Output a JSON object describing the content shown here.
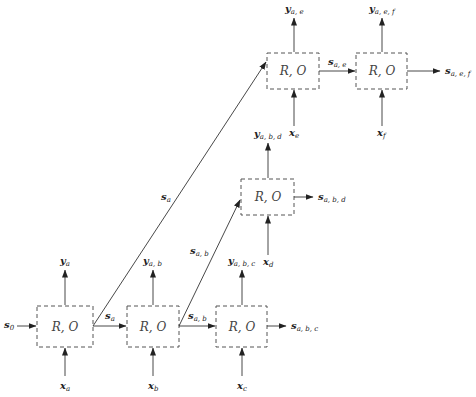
{
  "diagram": {
    "title": "",
    "node_label": "R, O",
    "nodes": [
      {
        "id": "a",
        "label": "R, O",
        "input": {
          "base": "x",
          "sub": "a"
        },
        "output": {
          "base": "y",
          "sub": "a"
        }
      },
      {
        "id": "b",
        "label": "R, O",
        "input": {
          "base": "x",
          "sub": "b"
        },
        "output": {
          "base": "y",
          "sub": "a, b"
        }
      },
      {
        "id": "c",
        "label": "R, O",
        "input": {
          "base": "x",
          "sub": "c"
        },
        "output": {
          "base": "y",
          "sub": "a, b, c"
        }
      },
      {
        "id": "d",
        "label": "R, O",
        "input": {
          "base": "x",
          "sub": "d"
        },
        "output": {
          "base": "y",
          "sub": "a, b, d"
        }
      },
      {
        "id": "e",
        "label": "R, O",
        "input": {
          "base": "x",
          "sub": "e"
        },
        "output": {
          "base": "y",
          "sub": "a, e"
        }
      },
      {
        "id": "f",
        "label": "R, O",
        "input": {
          "base": "x",
          "sub": "f"
        },
        "output": {
          "base": "y",
          "sub": "a, e, f"
        }
      }
    ],
    "states": {
      "s0": {
        "base": "s",
        "sub": "0"
      },
      "sa_ab": {
        "base": "s",
        "sub": "a"
      },
      "sa_ae": {
        "base": "s",
        "sub": "a"
      },
      "sab_bc": {
        "base": "s",
        "sub": "a, b"
      },
      "sab_bd": {
        "base": "s",
        "sub": "a, b"
      },
      "sabc_out": {
        "base": "s",
        "sub": "a, b, c"
      },
      "sabd_out": {
        "base": "s",
        "sub": "a, b, d"
      },
      "sae_ef": {
        "base": "s",
        "sub": "a, e"
      },
      "saef_out": {
        "base": "s",
        "sub": "a, e, f"
      }
    },
    "edges": [
      {
        "from": "s0",
        "to": "a"
      },
      {
        "from": "a",
        "to": "b",
        "label": "s_a"
      },
      {
        "from": "a",
        "to": "e",
        "label": "s_a"
      },
      {
        "from": "b",
        "to": "c",
        "label": "s_a,b"
      },
      {
        "from": "b",
        "to": "d",
        "label": "s_a,b"
      },
      {
        "from": "c",
        "to": "out",
        "label": "s_a,b,c"
      },
      {
        "from": "d",
        "to": "out",
        "label": "s_a,b,d"
      },
      {
        "from": "e",
        "to": "f",
        "label": "s_a,e"
      },
      {
        "from": "f",
        "to": "out",
        "label": "s_a,e,f"
      }
    ]
  }
}
